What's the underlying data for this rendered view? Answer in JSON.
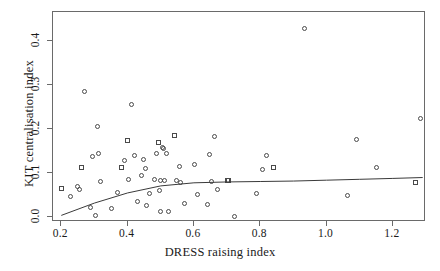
{
  "chart_data": {
    "type": "scatter",
    "title": "",
    "xlabel": "DRESS raising index",
    "ylabel": "KIT centralisation index",
    "xlim": [
      0.175,
      1.3
    ],
    "ylim": [
      -0.012,
      0.465
    ],
    "xticks": [
      0.2,
      0.4,
      0.6,
      0.8,
      1.0,
      1.2
    ],
    "xticklabels": [
      "0.2",
      "0.4",
      "0.6",
      "0.8",
      "1.0",
      "1.2"
    ],
    "yticks": [
      0.0,
      0.1,
      0.2,
      0.3,
      0.4
    ],
    "yticklabels": [
      "0.0",
      "0.1",
      "0.2",
      "0.3",
      "0.4"
    ],
    "grid": false,
    "legend": null,
    "marker_shapes": [
      "circle",
      "square"
    ],
    "trend_line": {
      "type": "smooth-fit",
      "x": [
        0.2,
        0.3,
        0.4,
        0.5,
        0.6,
        0.7,
        0.8,
        0.9,
        1.0,
        1.1,
        1.2,
        1.29
      ],
      "y": [
        0.003,
        0.031,
        0.054,
        0.07,
        0.077,
        0.079,
        0.08,
        0.081,
        0.083,
        0.085,
        0.087,
        0.089
      ]
    },
    "points": [
      {
        "x": 0.2,
        "y": 0.063,
        "shape": "square"
      },
      {
        "x": 0.227,
        "y": 0.046,
        "shape": "circle"
      },
      {
        "x": 0.25,
        "y": 0.068,
        "shape": "circle"
      },
      {
        "x": 0.256,
        "y": 0.062,
        "shape": "circle"
      },
      {
        "x": 0.262,
        "y": 0.112,
        "shape": "square"
      },
      {
        "x": 0.271,
        "y": 0.285,
        "shape": "circle"
      },
      {
        "x": 0.289,
        "y": 0.02,
        "shape": "circle"
      },
      {
        "x": 0.295,
        "y": 0.137,
        "shape": "circle"
      },
      {
        "x": 0.303,
        "y": 0.002,
        "shape": "circle"
      },
      {
        "x": 0.31,
        "y": 0.206,
        "shape": "circle"
      },
      {
        "x": 0.313,
        "y": 0.144,
        "shape": "circle"
      },
      {
        "x": 0.318,
        "y": 0.08,
        "shape": "circle"
      },
      {
        "x": 0.352,
        "y": 0.018,
        "shape": "circle"
      },
      {
        "x": 0.369,
        "y": 0.056,
        "shape": "circle"
      },
      {
        "x": 0.381,
        "y": 0.112,
        "shape": "square"
      },
      {
        "x": 0.392,
        "y": 0.127,
        "shape": "circle"
      },
      {
        "x": 0.4,
        "y": 0.172,
        "shape": "square"
      },
      {
        "x": 0.404,
        "y": 0.084,
        "shape": "circle"
      },
      {
        "x": 0.413,
        "y": 0.256,
        "shape": "circle"
      },
      {
        "x": 0.421,
        "y": 0.14,
        "shape": "circle"
      },
      {
        "x": 0.43,
        "y": 0.035,
        "shape": "circle"
      },
      {
        "x": 0.441,
        "y": 0.093,
        "shape": "circle"
      },
      {
        "x": 0.448,
        "y": 0.13,
        "shape": "circle"
      },
      {
        "x": 0.453,
        "y": 0.109,
        "shape": "circle"
      },
      {
        "x": 0.458,
        "y": 0.025,
        "shape": "circle"
      },
      {
        "x": 0.466,
        "y": 0.053,
        "shape": "circle"
      },
      {
        "x": 0.48,
        "y": 0.084,
        "shape": "circle"
      },
      {
        "x": 0.487,
        "y": 0.144,
        "shape": "circle"
      },
      {
        "x": 0.492,
        "y": 0.168,
        "shape": "square"
      },
      {
        "x": 0.497,
        "y": 0.06,
        "shape": "circle"
      },
      {
        "x": 0.5,
        "y": 0.012,
        "shape": "circle"
      },
      {
        "x": 0.5,
        "y": 0.083,
        "shape": "circle"
      },
      {
        "x": 0.505,
        "y": 0.158,
        "shape": "circle"
      },
      {
        "x": 0.509,
        "y": 0.155,
        "shape": "circle"
      },
      {
        "x": 0.512,
        "y": 0.082,
        "shape": "circle"
      },
      {
        "x": 0.518,
        "y": 0.144,
        "shape": "circle"
      },
      {
        "x": 0.522,
        "y": 0.012,
        "shape": "circle"
      },
      {
        "x": 0.54,
        "y": 0.185,
        "shape": "square"
      },
      {
        "x": 0.548,
        "y": 0.083,
        "shape": "circle"
      },
      {
        "x": 0.556,
        "y": 0.114,
        "shape": "circle"
      },
      {
        "x": 0.56,
        "y": 0.078,
        "shape": "circle"
      },
      {
        "x": 0.572,
        "y": 0.031,
        "shape": "circle"
      },
      {
        "x": 0.602,
        "y": 0.118,
        "shape": "circle"
      },
      {
        "x": 0.611,
        "y": 0.05,
        "shape": "circle"
      },
      {
        "x": 0.64,
        "y": 0.028,
        "shape": "circle"
      },
      {
        "x": 0.646,
        "y": 0.142,
        "shape": "circle"
      },
      {
        "x": 0.652,
        "y": 0.08,
        "shape": "circle"
      },
      {
        "x": 0.663,
        "y": 0.182,
        "shape": "circle"
      },
      {
        "x": 0.67,
        "y": 0.062,
        "shape": "circle"
      },
      {
        "x": 0.7,
        "y": 0.082,
        "shape": "square"
      },
      {
        "x": 0.705,
        "y": 0.082,
        "shape": "square"
      },
      {
        "x": 0.722,
        "y": 0.0,
        "shape": "circle"
      },
      {
        "x": 0.79,
        "y": 0.052,
        "shape": "circle"
      },
      {
        "x": 0.806,
        "y": 0.108,
        "shape": "circle"
      },
      {
        "x": 0.818,
        "y": 0.14,
        "shape": "circle"
      },
      {
        "x": 0.84,
        "y": 0.112,
        "shape": "square"
      },
      {
        "x": 0.935,
        "y": 0.428,
        "shape": "circle"
      },
      {
        "x": 1.063,
        "y": 0.048,
        "shape": "circle"
      },
      {
        "x": 1.09,
        "y": 0.176,
        "shape": "circle"
      },
      {
        "x": 1.15,
        "y": 0.112,
        "shape": "circle"
      },
      {
        "x": 1.268,
        "y": 0.078,
        "shape": "square"
      },
      {
        "x": 1.282,
        "y": 0.222,
        "shape": "circle"
      }
    ]
  },
  "style": {
    "axis_color": "#6a6a6a",
    "marker_color": "#4a4a4a",
    "line_color": "#3a3a3a",
    "background": "#ffffff"
  }
}
